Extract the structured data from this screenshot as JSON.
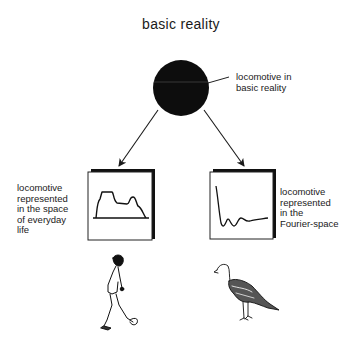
{
  "diagram": {
    "title": "basic reality",
    "center_node": {
      "shape": "filled-circle",
      "color": "#0d0d0d",
      "label": "locomotive in\nbasic reality"
    },
    "left_branch": {
      "label": "locomotive\nrepresented\nin the space\nof everyday\nlife",
      "panel": "space-domain silhouette plot",
      "figure": "walking-man-illustration"
    },
    "right_branch": {
      "label": "locomotive\nrepresented\nin the\nFourier-space",
      "panel": "Fourier-domain damped oscillation plot",
      "figure": "turkey-illustration"
    },
    "edges": [
      {
        "from": "center_node",
        "to": "left_branch",
        "type": "arrow"
      },
      {
        "from": "center_node",
        "to": "right_branch",
        "type": "arrow"
      }
    ]
  }
}
